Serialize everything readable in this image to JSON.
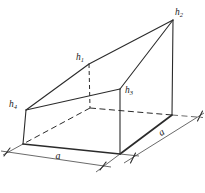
{
  "figure": {
    "kind": "geometry-diagram",
    "colors": {
      "background": "#ffffff",
      "edge": "#2b2b2b",
      "thin": "#444444"
    },
    "vertex_labels": {
      "h1": {
        "base": "h",
        "sub": "1"
      },
      "h2": {
        "base": "h",
        "sub": "2"
      },
      "h3": {
        "base": "h",
        "sub": "3"
      },
      "h4": {
        "base": "h",
        "sub": "4"
      }
    },
    "dimension_labels": {
      "front": "a",
      "side": "a"
    }
  }
}
